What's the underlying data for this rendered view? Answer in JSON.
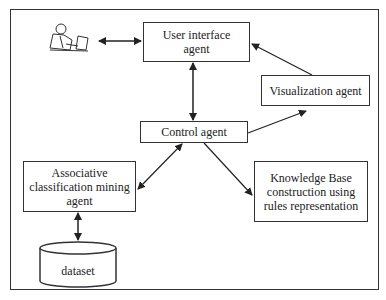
{
  "diagram": {
    "nodes": {
      "user_interface": "User interface agent",
      "user_interface_l1": "User interface",
      "user_interface_l2": "agent",
      "visualization": "Visualization agent",
      "control": "Control agent",
      "acm_l1": "Associative",
      "acm_l2": "classification mining",
      "acm_l3": "agent",
      "kb_l1": "Knowledge Base",
      "kb_l2": "construction using",
      "kb_l3": "rules representation",
      "dataset": "dataset",
      "user_icon": "user-at-computer-icon"
    },
    "edges": [
      {
        "from": "user",
        "to": "User interface agent",
        "type": "bidirectional"
      },
      {
        "from": "User interface agent",
        "to": "Control agent",
        "type": "bidirectional"
      },
      {
        "from": "Control agent",
        "to": "Visualization agent",
        "type": "directed"
      },
      {
        "from": "Visualization agent",
        "to": "User interface agent",
        "type": "directed"
      },
      {
        "from": "Control agent",
        "to": "Associative classification mining agent",
        "type": "bidirectional"
      },
      {
        "from": "Control agent",
        "to": "Knowledge Base construction using rules representation",
        "type": "directed"
      },
      {
        "from": "Associative classification mining agent",
        "to": "dataset",
        "type": "bidirectional"
      }
    ]
  }
}
